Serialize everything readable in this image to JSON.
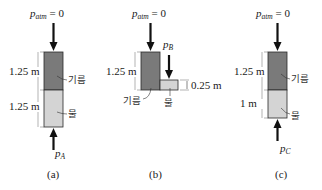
{
  "colors": {
    "oil": "#7a7a7a",
    "water": "#d4d4d4",
    "outline": "#2a2a2a",
    "arrow": "#111111"
  },
  "labels": {
    "p_atm": "p",
    "p_atm_sub": "atm",
    "p_atm_value": " = 0",
    "oil": "기름",
    "water": "물"
  },
  "panels": [
    {
      "id": "a",
      "caption": "(a)",
      "oil_height": "1.25 m",
      "water_height": "1.25 m",
      "pressure_symbol": "p",
      "pressure_sub": "A"
    },
    {
      "id": "b",
      "caption": "(b)",
      "oil_height": "1.25 m",
      "water_height": "0.25 m",
      "pressure_symbol": "p",
      "pressure_sub": "B"
    },
    {
      "id": "c",
      "caption": "(c)",
      "oil_height": "1.25 m",
      "water_height": "1 m",
      "pressure_symbol": "p",
      "pressure_sub": "C"
    }
  ]
}
